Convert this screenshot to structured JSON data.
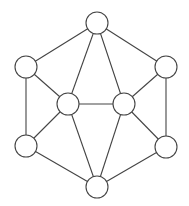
{
  "diagram": {
    "type": "undirected-graph",
    "canvas": {
      "width": 189,
      "height": 206
    },
    "colors": {
      "background": "#ffffff",
      "stroke": "#444444",
      "node_fill": "#ffffff"
    },
    "node_radius": 11,
    "nodes": [
      {
        "id": "top",
        "x": 97,
        "y": 23,
        "label": ""
      },
      {
        "id": "upper-left",
        "x": 26,
        "y": 67,
        "label": ""
      },
      {
        "id": "upper-right",
        "x": 166,
        "y": 67,
        "label": ""
      },
      {
        "id": "middle-left",
        "x": 68,
        "y": 104,
        "label": ""
      },
      {
        "id": "middle-right",
        "x": 124,
        "y": 104,
        "label": ""
      },
      {
        "id": "lower-left",
        "x": 26,
        "y": 146,
        "label": ""
      },
      {
        "id": "lower-right",
        "x": 166,
        "y": 147,
        "label": ""
      },
      {
        "id": "bottom",
        "x": 97,
        "y": 187,
        "label": ""
      }
    ],
    "edges": [
      [
        "top",
        "upper-left"
      ],
      [
        "top",
        "upper-right"
      ],
      [
        "top",
        "middle-left"
      ],
      [
        "top",
        "middle-right"
      ],
      [
        "upper-left",
        "lower-left"
      ],
      [
        "upper-left",
        "middle-left"
      ],
      [
        "upper-right",
        "lower-right"
      ],
      [
        "upper-right",
        "middle-right"
      ],
      [
        "middle-left",
        "middle-right"
      ],
      [
        "middle-left",
        "lower-left"
      ],
      [
        "middle-left",
        "bottom"
      ],
      [
        "middle-right",
        "lower-right"
      ],
      [
        "middle-right",
        "bottom"
      ],
      [
        "lower-left",
        "bottom"
      ],
      [
        "lower-right",
        "bottom"
      ]
    ]
  }
}
